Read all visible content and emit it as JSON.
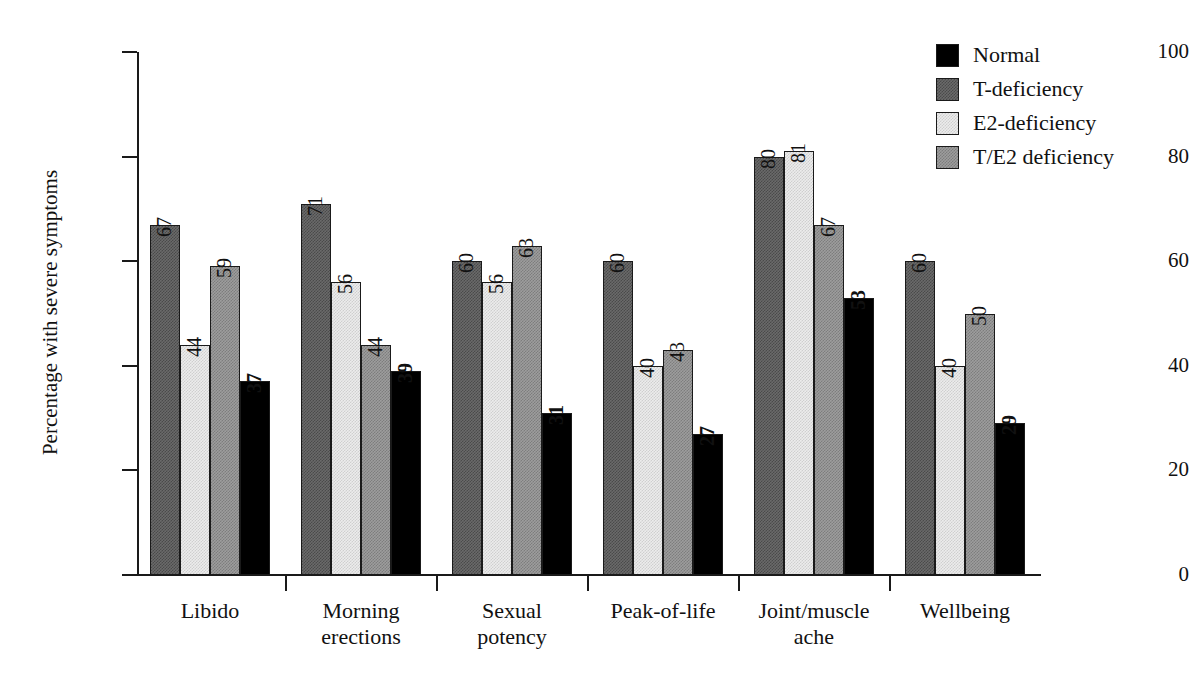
{
  "chart_data": {
    "type": "bar",
    "title": "",
    "xlabel": "",
    "ylabel": "Percentage with severe symptoms",
    "ylim": [
      0,
      100
    ],
    "yticks": [
      0,
      20,
      40,
      60,
      80,
      100
    ],
    "grid": false,
    "legend_position": "top-right",
    "categories": [
      "Libido",
      "Morning erections",
      "Sexual potency",
      "Peak-of-life",
      "Joint/muscle ache",
      "Wellbeing"
    ],
    "category_lines": [
      [
        "Libido"
      ],
      [
        "Morning",
        "erections"
      ],
      [
        "Sexual",
        "potency"
      ],
      [
        "Peak-of-life"
      ],
      [
        "Joint/muscle",
        "ache"
      ],
      [
        "Wellbeing"
      ]
    ],
    "series": [
      {
        "name": "T-deficiency",
        "pattern": "dark-checker",
        "color": "#6a6a6a",
        "values": [
          67,
          71,
          60,
          60,
          80,
          60
        ]
      },
      {
        "name": "E2-deficiency",
        "pattern": "light-checker",
        "color": "#ececec",
        "values": [
          44,
          56,
          56,
          40,
          81,
          40
        ]
      },
      {
        "name": "T/E2 deficiency",
        "pattern": "medium-checker",
        "color": "#9d9d9d",
        "values": [
          59,
          44,
          63,
          43,
          67,
          50
        ]
      },
      {
        "name": "Normal",
        "pattern": "solid-black",
        "color": "#000000",
        "values": [
          37,
          39,
          31,
          27,
          53,
          29
        ]
      }
    ]
  },
  "legend": {
    "items": [
      {
        "label": "Normal",
        "swatch": "solid-black"
      },
      {
        "label": "T-deficiency",
        "swatch": "dark-checker"
      },
      {
        "label": "E2-deficiency",
        "swatch": "light-checker"
      },
      {
        "label": "T/E2 deficiency",
        "swatch": "medium-checker"
      }
    ]
  },
  "axis": {
    "y_title": "Percentage with severe symptoms",
    "y_tick_labels": [
      "100",
      "80",
      "60",
      "40",
      "20",
      "0"
    ]
  }
}
